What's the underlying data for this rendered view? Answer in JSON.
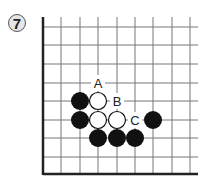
{
  "problem": {
    "number": "7"
  },
  "board": {
    "x_lines": [
      43,
      61,
      80,
      98,
      117,
      135,
      153,
      172,
      190
    ],
    "y_lines": [
      27,
      45,
      64,
      83,
      101,
      120,
      138,
      157,
      174
    ],
    "black_stones": [
      [
        80,
        101
      ],
      [
        80,
        120
      ],
      [
        98,
        138
      ],
      [
        117,
        138
      ],
      [
        135,
        138
      ],
      [
        153,
        120
      ]
    ],
    "white_stones": [
      [
        98,
        101
      ],
      [
        98,
        120
      ],
      [
        117,
        120
      ]
    ],
    "labels": [
      {
        "text": "A",
        "x": 98,
        "y": 83
      },
      {
        "text": "B",
        "x": 117,
        "y": 101
      },
      {
        "text": "C",
        "x": 135,
        "y": 120
      }
    ]
  }
}
